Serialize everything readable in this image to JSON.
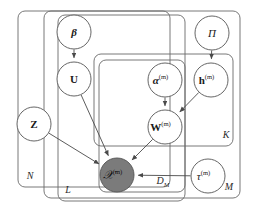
{
  "diagram": {
    "type": "plate-notation-graphical-model",
    "title": "",
    "colors": {
      "stroke": "#555555",
      "plate_stroke": "#6a6a6a",
      "node_fill": "#ffffff",
      "observed_fill": "#7b7b7b",
      "text": "#1a1a1a",
      "background": "#ffffff"
    },
    "nodes": [
      {
        "id": "beta",
        "label": "β",
        "sup": "",
        "style": "bold-italic",
        "observed": false,
        "cx": 74,
        "cy": 32,
        "r": 17
      },
      {
        "id": "U",
        "label": "U",
        "sup": "",
        "style": "bold",
        "observed": false,
        "cx": 74,
        "cy": 79,
        "r": 17
      },
      {
        "id": "Pi",
        "label": "Π",
        "sup": "",
        "style": "italic",
        "observed": false,
        "cx": 212,
        "cy": 33,
        "r": 17
      },
      {
        "id": "h",
        "label": "h",
        "sup": "(m)",
        "style": "bold",
        "observed": false,
        "cx": 211,
        "cy": 80,
        "r": 17
      },
      {
        "id": "alpha",
        "label": "α",
        "sup": "(m)",
        "style": "bold-italic",
        "observed": false,
        "cx": 165,
        "cy": 80,
        "r": 17
      },
      {
        "id": "W",
        "label": "W",
        "sup": "(m)",
        "style": "bold",
        "observed": false,
        "cx": 165,
        "cy": 127,
        "r": 17
      },
      {
        "id": "Z",
        "label": "Z",
        "sup": "",
        "style": "bold",
        "observed": false,
        "cx": 34,
        "cy": 124,
        "r": 17
      },
      {
        "id": "X",
        "label": "𝒳",
        "sup": "(m)",
        "style": "script",
        "observed": true,
        "cx": 117,
        "cy": 175,
        "r": 17
      },
      {
        "id": "tau",
        "label": "τ",
        "sup": "(m)",
        "style": "italic",
        "observed": false,
        "cx": 208,
        "cy": 176,
        "r": 17
      }
    ],
    "edges": [
      {
        "from": "beta",
        "to": "U"
      },
      {
        "from": "Pi",
        "to": "h"
      },
      {
        "from": "alpha",
        "to": "W"
      },
      {
        "from": "h",
        "to": "W"
      },
      {
        "from": "U",
        "to": "X"
      },
      {
        "from": "Z",
        "to": "X"
      },
      {
        "from": "W",
        "to": "X"
      },
      {
        "from": "tau",
        "to": "X"
      }
    ],
    "plates": [
      {
        "id": "plate-N",
        "label": "N",
        "x": 18,
        "y": 11,
        "w": 152,
        "h": 176,
        "label_x": 30,
        "label_y": 177
      },
      {
        "id": "plate-M",
        "label": "M",
        "x": 44,
        "y": 11,
        "w": 196,
        "h": 187,
        "label_x": 229,
        "label_y": 188
      },
      {
        "id": "plate-L",
        "label": "L",
        "x": 58,
        "y": 15,
        "w": 127,
        "h": 186,
        "label_x": 68,
        "label_y": 191
      },
      {
        "id": "plate-K",
        "label": "K",
        "x": 94,
        "y": 54,
        "w": 139,
        "h": 92,
        "label_x": 226,
        "label_y": 136
      },
      {
        "id": "plate-DM",
        "label": "D_M",
        "x": 99,
        "y": 60,
        "w": 86,
        "h": 132,
        "label_x": 163,
        "label_y": 182
      }
    ],
    "plate_label_texts": {
      "N": "N",
      "M": "M",
      "L": "L",
      "K": "K",
      "DM_base": "D",
      "DM_sub": "M"
    }
  }
}
